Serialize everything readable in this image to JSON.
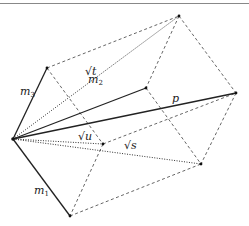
{
  "diagram": {
    "title": "",
    "colors": {
      "solid": "#222222",
      "dashed": "#555555",
      "dotted": "#333333",
      "point": "#111111"
    },
    "points": {
      "O": [
        13,
        139
      ],
      "A3": [
        47,
        68
      ],
      "T": [
        179,
        16
      ],
      "A2": [
        146,
        88
      ],
      "P": [
        236,
        93
      ],
      "U": [
        103,
        144
      ],
      "S": [
        201,
        164
      ],
      "A1": [
        70,
        216
      ]
    },
    "labels": {
      "m3": "m",
      "m3_sub": "3",
      "m2": "m",
      "m2_sub": "2",
      "m1": "m",
      "m1_sub": "1",
      "p": "p",
      "sqrt_t": "√t",
      "sqrt_u": "√u",
      "sqrt_s": "√s"
    }
  }
}
